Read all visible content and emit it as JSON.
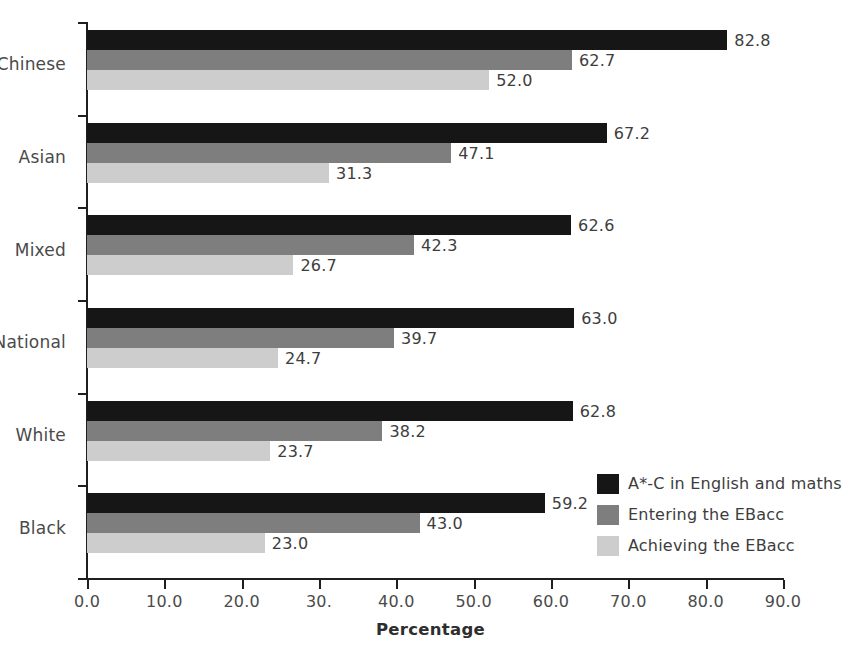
{
  "chart_data": {
    "type": "bar",
    "orientation": "horizontal",
    "title": "",
    "subtitle": "",
    "xlabel": "Percentage",
    "ylabel": "",
    "xlim": [
      0.0,
      90.0
    ],
    "xticks": [
      "0.0",
      "10.0",
      "20.0",
      "30.",
      "40.0",
      "50.0",
      "60.0",
      "70.0",
      "80.0",
      "90.0"
    ],
    "xtick_values": [
      0,
      10,
      20,
      30,
      40,
      50,
      60,
      70,
      80,
      90
    ],
    "grid": false,
    "legend_position": "inside-right-lower",
    "categories": [
      "Chinese",
      "Asian",
      "Mixed",
      "National",
      "White",
      "Black"
    ],
    "series": [
      {
        "name": "A*-C in English and maths",
        "color": "#161616",
        "values": [
          82.8,
          67.2,
          62.6,
          63.0,
          62.8,
          59.2
        ],
        "labels": [
          "82.8",
          "67.2",
          "62.6",
          "63.0",
          "62.8",
          "59.2"
        ]
      },
      {
        "name": "Entering the EBacc",
        "color": "#7e7e7e",
        "values": [
          62.7,
          47.1,
          42.3,
          39.7,
          38.2,
          43.0
        ],
        "labels": [
          "62.7",
          "47.1",
          "42.3",
          "39.7",
          "38.2",
          "43.0"
        ]
      },
      {
        "name": "Achieving the EBacc",
        "color": "#cdcdcd",
        "values": [
          52.0,
          31.3,
          26.7,
          24.7,
          23.7,
          23.0
        ],
        "labels": [
          "52.0",
          "31.3",
          "26.7",
          "24.7",
          "23.7",
          "23.0"
        ]
      }
    ]
  },
  "legend": {
    "items": [
      {
        "label": "A*-C in English and maths",
        "color": "#161616"
      },
      {
        "label": "Entering the EBacc",
        "color": "#7e7e7e"
      },
      {
        "label": "Achieving the EBacc",
        "color": "#cdcdcd"
      }
    ]
  },
  "axes": {
    "x_title": "Percentage"
  }
}
